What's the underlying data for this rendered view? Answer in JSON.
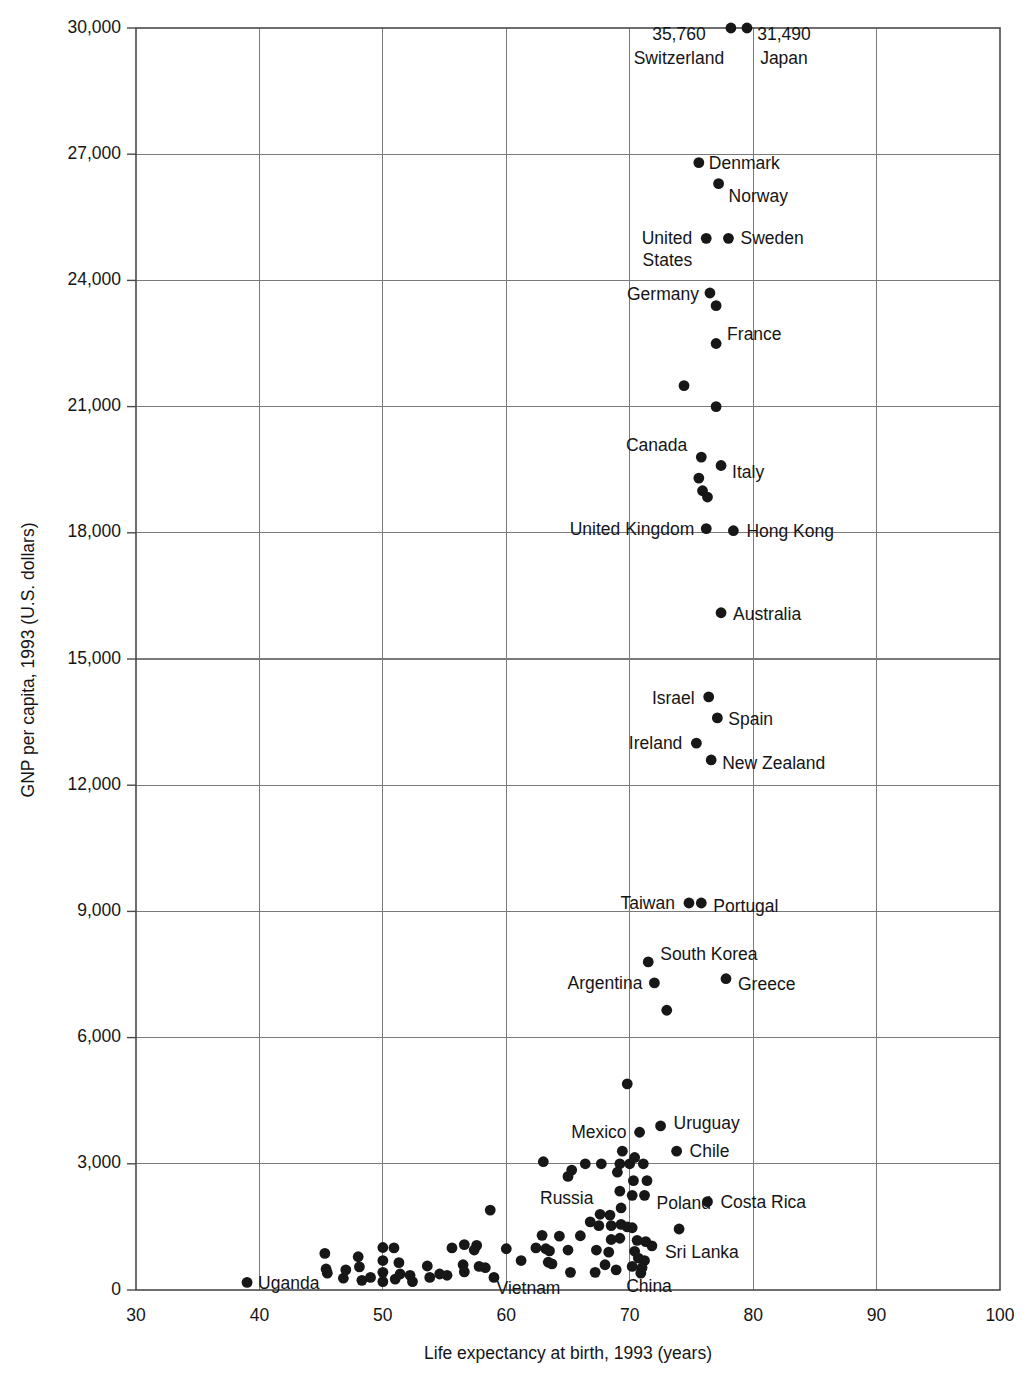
{
  "chart_data": {
    "type": "scatter",
    "title": "",
    "xlabel": "Life expectancy at birth, 1993 (years)",
    "ylabel": "GNP per capita, 1993 (U.S. dollars)",
    "xlim": [
      30,
      100
    ],
    "ylim": [
      0,
      30000
    ],
    "xticks": [
      "30",
      "40",
      "50",
      "60",
      "70",
      "80",
      "90",
      "100"
    ],
    "xtick_values": [
      30,
      40,
      50,
      60,
      70,
      80,
      90,
      100
    ],
    "yticks": [
      "0",
      "3,000",
      "6,000",
      "9,000",
      "12,000",
      "15,000",
      "18,000",
      "21,000",
      "24,000",
      "27,000",
      "30,000"
    ],
    "ytick_values": [
      0,
      3000,
      6000,
      9000,
      12000,
      15000,
      18000,
      21000,
      24000,
      27000,
      30000
    ],
    "grid": true,
    "legend": "none",
    "note": "Switzerland and Japan values exceed the plotted axis maximum and are annotated with their actual GNP per capita values above the top of the chart.",
    "labeled_points": [
      {
        "name": "Switzerland",
        "x": 78.2,
        "y": 30000,
        "value_label": "35,760",
        "label_anchor": "middle",
        "label_dx": -52,
        "label_dy": 36,
        "value_dx": -52,
        "value_dy": 12,
        "clipped": true
      },
      {
        "name": "Japan",
        "x": 79.5,
        "y": 30000,
        "value_label": "31,490",
        "label_anchor": "middle",
        "label_dx": 37,
        "label_dy": 36,
        "value_dx": 37,
        "value_dy": 12,
        "clipped": true
      },
      {
        "name": "Denmark",
        "x": 75.6,
        "y": 26800,
        "label_anchor": "start",
        "label_dx": 10,
        "label_dy": 6,
        "clipped": false
      },
      {
        "name": "Norway",
        "x": 77.2,
        "y": 26300,
        "label_anchor": "start",
        "label_dx": 10,
        "label_dy": 18,
        "clipped": false
      },
      {
        "name": "Sweden",
        "x": 78.0,
        "y": 25000,
        "label_anchor": "start",
        "label_dx": 12,
        "label_dy": 6,
        "clipped": false
      },
      {
        "name": "United States",
        "x": 76.2,
        "y": 25000,
        "label_anchor": "end",
        "label_dx": -14,
        "label_dy": 6,
        "clipped": false
      },
      {
        "name": "Germany",
        "x": 76.5,
        "y": 23700,
        "label_anchor": "end",
        "label_dx": -11,
        "label_dy": 7,
        "clipped": false
      },
      {
        "name": "France",
        "x": 77.0,
        "y": 22500,
        "label_anchor": "start",
        "label_dx": 11,
        "label_dy": -4,
        "clipped": false
      },
      {
        "name": "Canada",
        "x": 75.8,
        "y": 19800,
        "label_anchor": "end",
        "label_dx": -14,
        "label_dy": -6,
        "clipped": false
      },
      {
        "name": "Italy",
        "x": 77.4,
        "y": 19600,
        "label_anchor": "start",
        "label_dx": 11,
        "label_dy": 13,
        "clipped": false
      },
      {
        "name": "United Kingdom",
        "x": 76.2,
        "y": 18100,
        "label_anchor": "end",
        "label_dx": -12,
        "label_dy": 6,
        "clipped": false
      },
      {
        "name": "Hong Kong",
        "x": 78.4,
        "y": 18050,
        "label_anchor": "start",
        "label_dx": 13,
        "label_dy": 6,
        "clipped": false
      },
      {
        "name": "Australia",
        "x": 77.4,
        "y": 16100,
        "label_anchor": "start",
        "label_dx": 12,
        "label_dy": 7,
        "clipped": false
      },
      {
        "name": "Israel",
        "x": 76.4,
        "y": 14100,
        "label_anchor": "end",
        "label_dx": -14,
        "label_dy": 7,
        "clipped": false
      },
      {
        "name": "Spain",
        "x": 77.1,
        "y": 13600,
        "label_anchor": "start",
        "label_dx": 11,
        "label_dy": 7,
        "clipped": false
      },
      {
        "name": "Ireland",
        "x": 75.4,
        "y": 13000,
        "label_anchor": "end",
        "label_dx": -14,
        "label_dy": 6,
        "clipped": false
      },
      {
        "name": "New Zealand",
        "x": 76.6,
        "y": 12600,
        "label_anchor": "start",
        "label_dx": 11,
        "label_dy": 9,
        "clipped": false
      },
      {
        "name": "Taiwan",
        "x": 74.8,
        "y": 9200,
        "label_anchor": "end",
        "label_dx": -14,
        "label_dy": 6,
        "clipped": false
      },
      {
        "name": "Portugal",
        "x": 75.8,
        "y": 9200,
        "label_anchor": "start",
        "label_dx": 12,
        "label_dy": 9,
        "clipped": false
      },
      {
        "name": "South Korea",
        "x": 71.5,
        "y": 7800,
        "label_anchor": "start",
        "label_dx": 12,
        "label_dy": -2,
        "clipped": false
      },
      {
        "name": "Argentina",
        "x": 72.0,
        "y": 7300,
        "label_anchor": "end",
        "label_dx": -12,
        "label_dy": 6,
        "clipped": false
      },
      {
        "name": "Greece",
        "x": 77.8,
        "y": 7400,
        "label_anchor": "start",
        "label_dx": 12,
        "label_dy": 11,
        "clipped": false
      },
      {
        "name": "Mexico",
        "x": 70.8,
        "y": 3750,
        "label_anchor": "end",
        "label_dx": -13,
        "label_dy": 6,
        "clipped": false
      },
      {
        "name": "Uruguay",
        "x": 72.5,
        "y": 3900,
        "label_anchor": "start",
        "label_dx": 13,
        "label_dy": 3,
        "clipped": false
      },
      {
        "name": "Chile",
        "x": 73.8,
        "y": 3300,
        "label_anchor": "start",
        "label_dx": 13,
        "label_dy": 6,
        "clipped": false
      },
      {
        "name": "Russia",
        "x": 65.0,
        "y": 2700,
        "label_anchor": "start",
        "label_dx": -28,
        "label_dy": 28,
        "clipped": false
      },
      {
        "name": "Poland",
        "x": 71.2,
        "y": 2250,
        "label_anchor": "start",
        "label_dx": 12,
        "label_dy": 14,
        "clipped": false
      },
      {
        "name": "Costa Rica",
        "x": 76.3,
        "y": 2100,
        "label_anchor": "start",
        "label_dx": 13,
        "label_dy": 6,
        "clipped": false
      },
      {
        "name": "Sri Lanka",
        "x": 71.8,
        "y": 1050,
        "label_anchor": "start",
        "label_dx": 13,
        "label_dy": 12,
        "clipped": false
      },
      {
        "name": "China",
        "x": 68.9,
        "y": 480,
        "label_anchor": "start",
        "label_dx": 10,
        "label_dy": 22,
        "clipped": false
      },
      {
        "name": "Vietnam",
        "x": 65.2,
        "y": 420,
        "label_anchor": "end",
        "label_dx": -10,
        "label_dy": 22,
        "clipped": false
      },
      {
        "name": "Uganda",
        "x": 39.0,
        "y": 180,
        "label_anchor": "start",
        "label_dx": 11,
        "label_dy": 7,
        "clipped": false
      }
    ],
    "unlabeled_points": [
      {
        "x": 77.0,
        "y": 23400
      },
      {
        "x": 74.4,
        "y": 21500
      },
      {
        "x": 77.0,
        "y": 21000
      },
      {
        "x": 75.6,
        "y": 19300
      },
      {
        "x": 75.9,
        "y": 19000
      },
      {
        "x": 76.3,
        "y": 18850
      },
      {
        "x": 73.0,
        "y": 6650
      },
      {
        "x": 69.8,
        "y": 4900
      },
      {
        "x": 63.0,
        "y": 3050
      },
      {
        "x": 66.4,
        "y": 3000
      },
      {
        "x": 67.7,
        "y": 3000
      },
      {
        "x": 69.2,
        "y": 3000
      },
      {
        "x": 70.0,
        "y": 3000
      },
      {
        "x": 71.1,
        "y": 3000
      },
      {
        "x": 69.4,
        "y": 3300
      },
      {
        "x": 70.4,
        "y": 3150
      },
      {
        "x": 65.3,
        "y": 2850
      },
      {
        "x": 69.0,
        "y": 2800
      },
      {
        "x": 70.3,
        "y": 2600
      },
      {
        "x": 71.4,
        "y": 2600
      },
      {
        "x": 69.2,
        "y": 2350
      },
      {
        "x": 70.2,
        "y": 2250
      },
      {
        "x": 69.3,
        "y": 1950
      },
      {
        "x": 58.7,
        "y": 1900
      },
      {
        "x": 67.6,
        "y": 1800
      },
      {
        "x": 68.4,
        "y": 1780
      },
      {
        "x": 66.8,
        "y": 1620
      },
      {
        "x": 67.5,
        "y": 1530
      },
      {
        "x": 68.5,
        "y": 1530
      },
      {
        "x": 69.3,
        "y": 1560
      },
      {
        "x": 69.8,
        "y": 1500
      },
      {
        "x": 70.2,
        "y": 1480
      },
      {
        "x": 74.0,
        "y": 1450
      },
      {
        "x": 62.9,
        "y": 1300
      },
      {
        "x": 64.3,
        "y": 1280
      },
      {
        "x": 66.0,
        "y": 1290
      },
      {
        "x": 68.5,
        "y": 1200
      },
      {
        "x": 69.2,
        "y": 1230
      },
      {
        "x": 70.6,
        "y": 1180
      },
      {
        "x": 71.3,
        "y": 1150
      },
      {
        "x": 56.6,
        "y": 1080
      },
      {
        "x": 57.6,
        "y": 1060
      },
      {
        "x": 60.0,
        "y": 980
      },
      {
        "x": 62.4,
        "y": 1000
      },
      {
        "x": 63.2,
        "y": 980
      },
      {
        "x": 63.5,
        "y": 930
      },
      {
        "x": 65.0,
        "y": 950
      },
      {
        "x": 67.3,
        "y": 950
      },
      {
        "x": 68.3,
        "y": 900
      },
      {
        "x": 70.4,
        "y": 920
      },
      {
        "x": 70.7,
        "y": 760
      },
      {
        "x": 71.2,
        "y": 700
      },
      {
        "x": 61.2,
        "y": 700
      },
      {
        "x": 63.4,
        "y": 660
      },
      {
        "x": 63.7,
        "y": 620
      },
      {
        "x": 68.0,
        "y": 600
      },
      {
        "x": 70.2,
        "y": 560
      },
      {
        "x": 71.0,
        "y": 530
      },
      {
        "x": 67.2,
        "y": 420
      },
      {
        "x": 70.9,
        "y": 400
      },
      {
        "x": 45.3,
        "y": 870
      },
      {
        "x": 45.4,
        "y": 500
      },
      {
        "x": 45.5,
        "y": 400
      },
      {
        "x": 47.0,
        "y": 480
      },
      {
        "x": 48.0,
        "y": 790
      },
      {
        "x": 48.1,
        "y": 550
      },
      {
        "x": 48.3,
        "y": 230
      },
      {
        "x": 50.0,
        "y": 1010
      },
      {
        "x": 50.0,
        "y": 700
      },
      {
        "x": 50.0,
        "y": 420
      },
      {
        "x": 50.0,
        "y": 200
      },
      {
        "x": 50.9,
        "y": 1000
      },
      {
        "x": 51.3,
        "y": 650
      },
      {
        "x": 51.4,
        "y": 380
      },
      {
        "x": 52.2,
        "y": 350
      },
      {
        "x": 52.4,
        "y": 200
      },
      {
        "x": 53.6,
        "y": 570
      },
      {
        "x": 54.6,
        "y": 380
      },
      {
        "x": 55.6,
        "y": 1000
      },
      {
        "x": 56.5,
        "y": 600
      },
      {
        "x": 56.6,
        "y": 430
      },
      {
        "x": 57.4,
        "y": 950
      },
      {
        "x": 57.8,
        "y": 560
      },
      {
        "x": 58.3,
        "y": 530
      },
      {
        "x": 59.0,
        "y": 300
      },
      {
        "x": 55.2,
        "y": 350
      },
      {
        "x": 53.8,
        "y": 300
      },
      {
        "x": 51.0,
        "y": 260
      },
      {
        "x": 49.0,
        "y": 300
      },
      {
        "x": 46.8,
        "y": 280
      }
    ]
  },
  "axes": {
    "x_axis_title": "Life expectancy at birth, 1993 (years)",
    "y_axis_title": "GNP per capita, 1993 (U.S. dollars)"
  },
  "colors": {
    "point": "#171717",
    "gridline": "#7a7a7a",
    "frame": "#4a4a4a",
    "text": "#151515",
    "background": "#ffffff"
  }
}
